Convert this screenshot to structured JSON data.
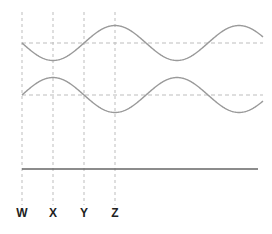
{
  "diagram": {
    "type": "phase-wave-diagram",
    "colors": {
      "wave": "#9a9a9a",
      "dashed": "#bdbdbd",
      "solid_line": "#666666",
      "label": "#222222"
    },
    "markers": [
      {
        "label": "W",
        "x": 22
      },
      {
        "label": "X",
        "x": 53
      },
      {
        "label": "Y",
        "x": 84
      },
      {
        "label": "Z",
        "x": 115
      }
    ],
    "waves": [
      {
        "name": "top-wave",
        "baseline_y": 43,
        "amplitude": 17.5,
        "start_x": 22,
        "end_x": 263,
        "period": 124,
        "start_direction": "down"
      },
      {
        "name": "bottom-wave",
        "baseline_y": 95,
        "amplitude": 17.5,
        "start_x": 22,
        "end_x": 263,
        "period": 124,
        "start_direction": "up"
      }
    ],
    "solid_line": {
      "y": 169,
      "x1": 22,
      "x2": 258
    }
  }
}
